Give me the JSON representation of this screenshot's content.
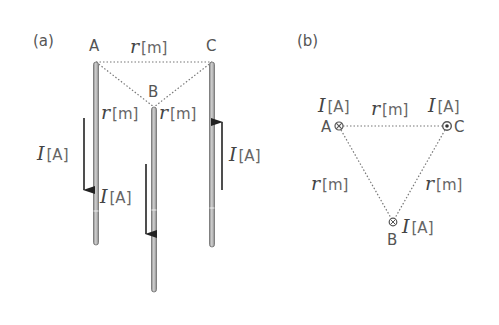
{
  "panel_a": {
    "label": "(a)",
    "wires": [
      {
        "name": "A",
        "current_dir": "down"
      },
      {
        "name": "B",
        "current_dir": "down"
      },
      {
        "name": "C",
        "current_dir": "up"
      }
    ],
    "wire_label_A": "A",
    "wire_label_B": "B",
    "wire_label_C": "C",
    "distance_AC": {
      "var": "r",
      "unit": "[m]"
    },
    "distance_AB": {
      "var": "r",
      "unit": "[m]"
    },
    "distance_BC": {
      "var": "r",
      "unit": "[m]"
    },
    "current_A": {
      "var": "I",
      "unit": "[A]"
    },
    "current_B": {
      "var": "I",
      "unit": "[A]"
    },
    "current_C": {
      "var": "I",
      "unit": "[A]"
    }
  },
  "panel_b": {
    "label": "(b)",
    "point_A": {
      "name": "A",
      "symbol": "into-page",
      "current": {
        "var": "I",
        "unit": "[A]"
      }
    },
    "point_B": {
      "name": "B",
      "symbol": "into-page",
      "current": {
        "var": "I",
        "unit": "[A]"
      }
    },
    "point_C": {
      "name": "C",
      "symbol": "out-of-page",
      "current": {
        "var": "I",
        "unit": "[A]"
      }
    },
    "distance_AC": {
      "var": "r",
      "unit": "[m]"
    },
    "distance_AB": {
      "var": "r",
      "unit": "[m]"
    },
    "distance_BC": {
      "var": "r",
      "unit": "[m]"
    }
  },
  "colors": {
    "wire_fill": "#b5b5b5",
    "wire_edge": "#6e6e6e",
    "arrow": "#222222",
    "text": "#555555"
  }
}
